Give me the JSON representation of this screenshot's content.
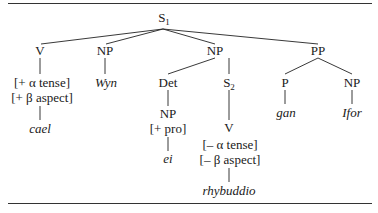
{
  "diagram": {
    "type": "syntax-tree",
    "root": {
      "label": "S",
      "subscript": "1"
    },
    "nodes": {
      "v1": {
        "label": "V"
      },
      "v1_feat1": {
        "label": "[+ α tense]"
      },
      "v1_feat2": {
        "label": "[+ β aspect]"
      },
      "v1_word": {
        "label": "cael"
      },
      "np1": {
        "label": "NP"
      },
      "np1_word": {
        "label": "Wyn"
      },
      "np2": {
        "label": "NP"
      },
      "det": {
        "label": "Det"
      },
      "det_np": {
        "label": "NP"
      },
      "det_np_feat": {
        "label": "[+ pro]"
      },
      "det_np_word": {
        "label": "ei"
      },
      "s2": {
        "label": "S",
        "subscript": "2"
      },
      "v2": {
        "label": "V"
      },
      "v2_feat1": {
        "label": "[– α tense]"
      },
      "v2_feat2": {
        "label": "[– β aspect]"
      },
      "v2_word": {
        "label": "rhybuddio"
      },
      "pp": {
        "label": "PP"
      },
      "p": {
        "label": "P"
      },
      "p_word": {
        "label": "gan"
      },
      "pp_np": {
        "label": "NP"
      },
      "pp_np_word": {
        "label": "Ifor"
      }
    },
    "edges": [
      [
        "S1",
        "V"
      ],
      [
        "S1",
        "NP(Wyn)"
      ],
      [
        "S1",
        "NP"
      ],
      [
        "S1",
        "PP"
      ],
      [
        "V",
        "[+ α tense] [+ β aspect]"
      ],
      [
        "[+ β aspect]",
        "cael"
      ],
      [
        "NP(Wyn)",
        "Wyn"
      ],
      [
        "NP",
        "Det"
      ],
      [
        "NP",
        "S2"
      ],
      [
        "Det",
        "NP [+ pro]"
      ],
      [
        "[+ pro]",
        "ei"
      ],
      [
        "S2",
        "V"
      ],
      [
        "[– β aspect]",
        "rhybuddio"
      ],
      [
        "PP",
        "P"
      ],
      [
        "PP",
        "NP"
      ],
      [
        "P",
        "gan"
      ],
      [
        "NP",
        "Ifor"
      ]
    ]
  }
}
